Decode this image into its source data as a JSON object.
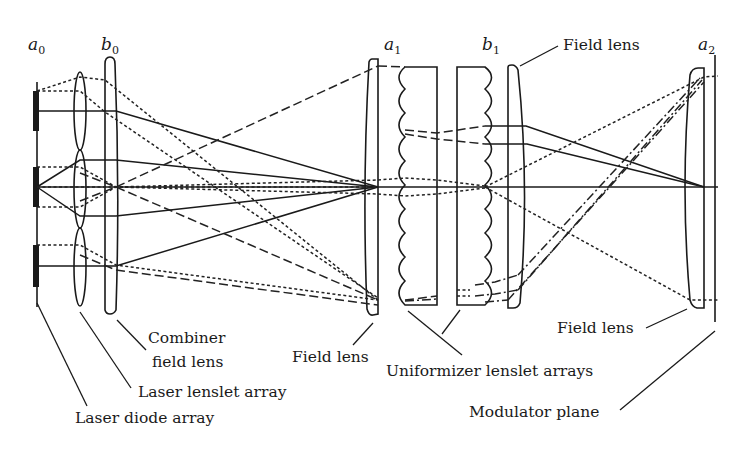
{
  "symbols": {
    "a0": {
      "base": "a",
      "sub": "0"
    },
    "b0": {
      "base": "b",
      "sub": "0"
    },
    "a1": {
      "base": "a",
      "sub": "1"
    },
    "b1": {
      "base": "b",
      "sub": "1"
    },
    "a2": {
      "base": "a",
      "sub": "2"
    }
  },
  "labels": {
    "field_lens_top": "Field lens",
    "combiner_line1": "Combiner",
    "combiner_line2": "field lens",
    "field_lens_a1": "Field lens",
    "laser_lenslet_array": "Laser lenslet array",
    "laser_diode_array": "Laser diode array",
    "uniformizer_lenslet_arrays": "Uniformizer lenslet arrays",
    "field_lens_a2": "Field lens",
    "modulator_plane": "Modulator plane"
  },
  "components": [
    {
      "id": "laser-diode-array",
      "symbol": "a0",
      "count": 3
    },
    {
      "id": "laser-lenslet-array",
      "count": 3
    },
    {
      "id": "combiner-field-lens",
      "symbol": "b0"
    },
    {
      "id": "field-lens-a1",
      "symbol": "a1"
    },
    {
      "id": "uniformizer-lenslet-array-1",
      "lenslets": 10
    },
    {
      "id": "uniformizer-lenslet-array-2",
      "symbol": "b1",
      "lenslets": 10
    },
    {
      "id": "field-lens-b1"
    },
    {
      "id": "field-lens-a2",
      "symbol": "a2"
    },
    {
      "id": "modulator-plane"
    }
  ],
  "ray_styles": [
    "solid",
    "dotted",
    "dashed",
    "dash-dot"
  ],
  "colors": {
    "ink": "#1a1a1a",
    "background": "#ffffff"
  }
}
